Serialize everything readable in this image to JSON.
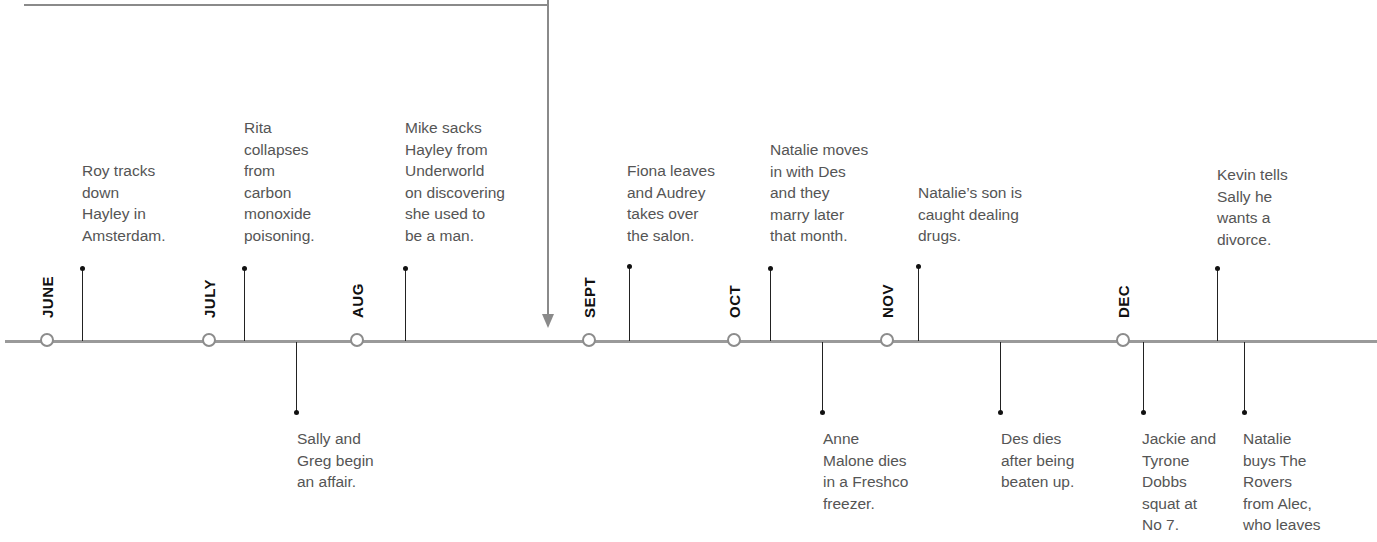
{
  "diagram": {
    "type": "timeline",
    "months": [
      {
        "label": "JUNE",
        "x": 48
      },
      {
        "label": "JULY",
        "x": 210
      },
      {
        "label": "AUG",
        "x": 358
      },
      {
        "label": "SEPT",
        "x": 590
      },
      {
        "label": "OCT",
        "x": 735
      },
      {
        "label": "NOV",
        "x": 888
      },
      {
        "label": "DEC",
        "x": 1124
      }
    ],
    "events_above": [
      {
        "x": 82,
        "text": "Roy tracks\ndown\nHayley in\nAmsterdam."
      },
      {
        "x": 244,
        "text": "Rita\ncollapses\nfrom\ncarbon\nmonoxide\npoisoning."
      },
      {
        "x": 405,
        "text": "Mike sacks\nHayley from\nUnderworld\non discovering\nshe used to\nbe a man."
      },
      {
        "x": 629,
        "text": "Fiona leaves\nand Audrey\ntakes over\nthe salon."
      },
      {
        "x": 770,
        "text": "Natalie moves\nin with Des\nand they\nmarry later\nthat month."
      },
      {
        "x": 918,
        "text": "Natalie’s son is\ncaught dealing\ndrugs."
      },
      {
        "x": 1217,
        "text": "Kevin tells\nSally he\nwants a\ndivorce."
      }
    ],
    "events_below": [
      {
        "x": 296,
        "text": "Sally and\nGreg begin\nan affair."
      },
      {
        "x": 822,
        "text": "Anne\nMalone dies\nin a Freshco\nfreezer."
      },
      {
        "x": 1000,
        "text": "Des dies\nafter being\nbeaten up."
      },
      {
        "x": 1143,
        "text": "Jackie and\nTyrone\nDobbs\nsquat at\nNo 7."
      },
      {
        "x": 1244,
        "text": "Natalie\nbuys The\nRovers\nfrom Alec,\nwho leaves"
      }
    ],
    "colors": {
      "axis": "#9a9a9a",
      "month_text": "#111111",
      "event_text": "#555555",
      "stem": "#222222"
    }
  }
}
